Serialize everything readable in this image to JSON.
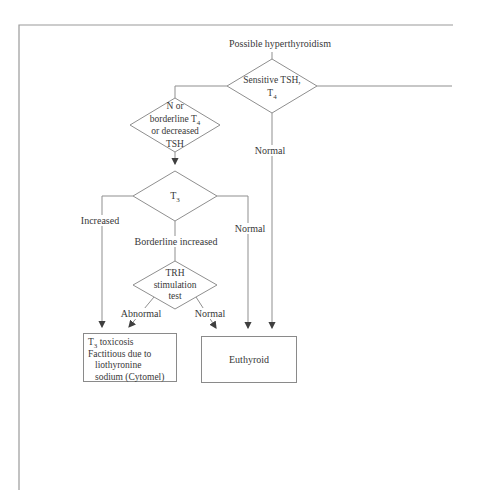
{
  "title": "Possible hyperthyroidism",
  "colors": {
    "line": "#8f8f8f",
    "arrow": "#3f3f3f",
    "text": "#383838",
    "background": "#ffffff"
  },
  "nodes": {
    "sensitive_tsh": {
      "line1": "Sensitive TSH,",
      "line2_base": "T",
      "line2_sub": "4"
    },
    "borderline_t4": {
      "line1": "N or",
      "line2_base": "borderline T",
      "line2_sub": "4",
      "line3": "or decreased",
      "line4": "TSH"
    },
    "t3": {
      "base": "T",
      "sub": "3"
    },
    "trh": {
      "line1": "TRH",
      "line2": "stimulation",
      "line3": "test"
    },
    "t3_toxicosis": {
      "line1_base": "T",
      "line1_sub": "3",
      "line1_rest": " toxicosis",
      "line2": "Factitious due to",
      "line3": "liothyronine",
      "line4": "sodium (Cytomel)"
    },
    "euthyroid": {
      "label": "Euthyroid"
    }
  },
  "edge_labels": {
    "tsh_normal": "Normal",
    "t3_increased": "Increased",
    "t3_borderline": "Borderline increased",
    "t3_normal": "Normal",
    "trh_abnormal": "Abnormal",
    "trh_normal": "Normal"
  }
}
